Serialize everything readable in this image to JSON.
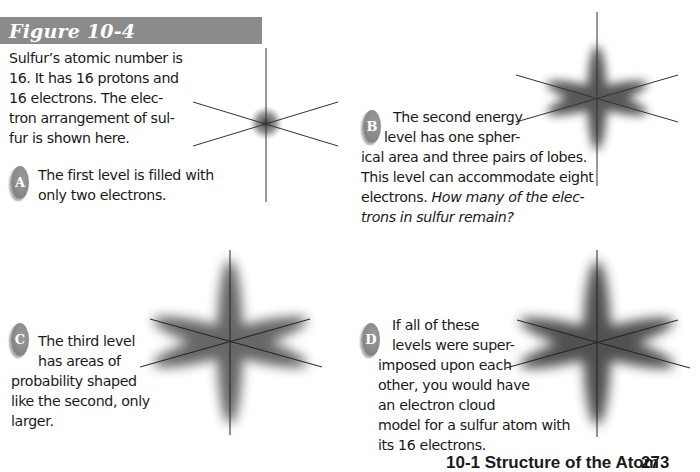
{
  "figure": {
    "title": "Figure 10-4",
    "header_color": "#8b8b8b"
  },
  "intro": {
    "lines": [
      "Sulfur’s atomic number is",
      "16. It has 16 protons and",
      "16 electrons. The elec-",
      "tron arrangement of sul-",
      "fur is shown here."
    ]
  },
  "panels": [
    {
      "badge": "A",
      "lines": [
        "The first level is filled with",
        "only two electrons."
      ]
    },
    {
      "badge": "B",
      "lines": [
        "The second energy",
        "level has one spher-",
        "ical area and three pairs of lobes.",
        "This level can accommodate eight",
        "electrons."
      ],
      "italic_lines": [
        "How many of the elec-",
        "trons in sulfur remain?"
      ]
    },
    {
      "badge": "C",
      "lines": [
        "The third level",
        "has areas of",
        "probability shaped",
        "like the second, only",
        "larger."
      ]
    },
    {
      "badge": "D",
      "lines": [
        "If all of these",
        "levels were super-",
        "imposed upon each",
        "other, you would have",
        "an electron cloud",
        "model for a sulfur atom with",
        "its 16 electrons."
      ]
    }
  ],
  "diagrams": [
    {
      "name": "first-level-orbital-diagram",
      "center": [
        266,
        123
      ],
      "type": "sphere"
    },
    {
      "name": "second-level-orbital-diagram",
      "center": [
        597,
        98
      ],
      "type": "lobes"
    },
    {
      "name": "third-level-orbital-diagram",
      "center": [
        230,
        342
      ],
      "type": "lobes-large"
    },
    {
      "name": "electron-cloud-model-diagram",
      "center": [
        597,
        343
      ],
      "type": "lobes-large"
    }
  ],
  "footer": {
    "section": "10-1 Structure of the Atom",
    "page_number": "273"
  }
}
